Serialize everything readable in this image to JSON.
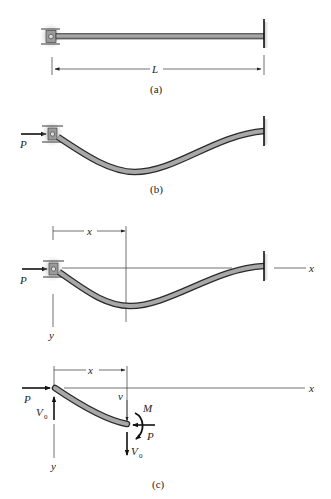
{
  "figure": {
    "panels": [
      {
        "id": "a",
        "caption": "(a)",
        "description": "Straight column, pin-roller support at left, fixed at right",
        "dimension_label": "L"
      },
      {
        "id": "b",
        "caption": "(b)",
        "description": "Buckled column under axial load P",
        "load_label": "P"
      },
      {
        "id": "c_top",
        "description": "Buckled column with coordinate axes",
        "load_label": "P",
        "x_dim_label": "x",
        "x_axis_label": "x",
        "y_axis_label": "y"
      },
      {
        "id": "c_bottom",
        "caption": "(c)",
        "description": "Free-body diagram of column segment",
        "load_left_label": "P",
        "shear_left_label": "V",
        "shear_left_sub": "0",
        "x_dim_label": "x",
        "x_axis_label": "x",
        "y_axis_label": "y",
        "deflection_label": "v",
        "moment_label": "M",
        "load_right_label": "P",
        "shear_right_label": "V",
        "shear_right_sub": "0"
      }
    ]
  },
  "colors": {
    "beam_fill": "#8a8a8a",
    "beam_edge": "#2a2a2a",
    "support_shadow": "#bdbdbd",
    "line": "#222222"
  }
}
